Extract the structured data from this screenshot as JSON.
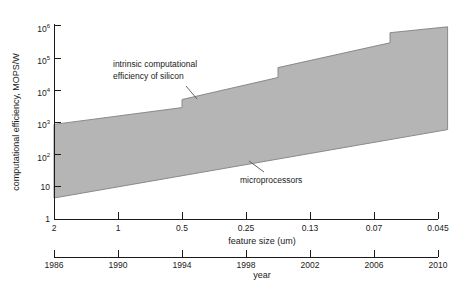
{
  "chart_data": {
    "type": "area",
    "title": "",
    "ylabel": "computational efficiency, MOPS/W",
    "xlabel_primary": "feature size (um)",
    "xlabel_secondary": "year",
    "x_year_ticks": [
      "1986",
      "1990",
      "1994",
      "1998",
      "2002",
      "2006",
      "2010"
    ],
    "x_feature_size_ticks": [
      "2",
      "1",
      "0.5",
      "0.25",
      "0.13",
      "0.07",
      "0.045"
    ],
    "y_tick_labels": [
      "1",
      "10",
      "10^2",
      "10^3",
      "10^4",
      "10^5",
      "10^6"
    ],
    "y_tick_values": [
      1,
      10,
      100,
      1000,
      10000,
      100000,
      1000000
    ],
    "ylim": [
      1,
      1000000
    ],
    "xlim_years": [
      1986,
      2010
    ],
    "grid": false,
    "legend": "none",
    "band_color": "#b5b5b5",
    "band_edge_color": "#808080",
    "axis_color": "#1a1a1a",
    "series": [
      {
        "name": "intrinsic computational efficiency of silicon",
        "role": "band-top-edge",
        "points": [
          {
            "year": 1986,
            "value": 870
          },
          {
            "year": 1994,
            "value": 2900
          },
          {
            "year": 1994,
            "value": 5200
          },
          {
            "year": 2000,
            "value": 25000
          },
          {
            "year": 2000,
            "value": 51000
          },
          {
            "year": 2007,
            "value": 300000
          },
          {
            "year": 2007,
            "value": 620000
          },
          {
            "year": 2010.6,
            "value": 940000
          }
        ]
      },
      {
        "name": "microprocessors",
        "role": "band-bottom-edge",
        "points": [
          {
            "year": 1986,
            "value": 4.5
          },
          {
            "year": 2010.6,
            "value": 600
          }
        ]
      }
    ],
    "annotations": [
      {
        "id": "intrinsic",
        "line1": "intrinsic computational",
        "line2": "efficiency of silicon"
      },
      {
        "id": "microprocessors",
        "text": "microprocessors"
      }
    ]
  }
}
